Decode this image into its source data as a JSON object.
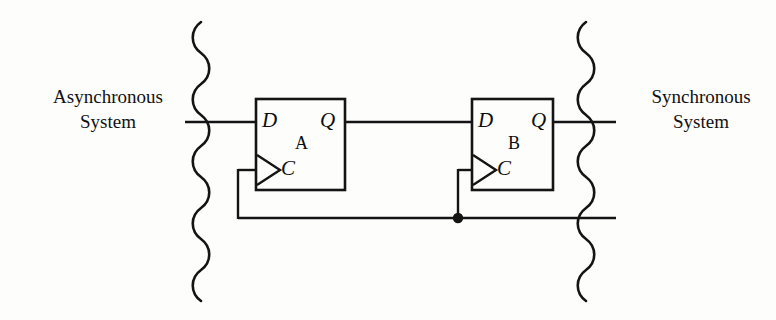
{
  "figure": {
    "background_color": "#fdfdfc",
    "line_color": "#111111"
  },
  "labels": {
    "async_system": {
      "line1": "Asynchronous",
      "line2": "System"
    },
    "sync_system": {
      "line1": "Synchronous",
      "line2": "System"
    }
  },
  "flipflops": [
    {
      "id": "ff-a",
      "name": "A",
      "d_label": "D",
      "q_label": "Q",
      "c_label": "C",
      "box": {
        "x": 256,
        "y": 99,
        "w": 89,
        "h": 91
      }
    },
    {
      "id": "ff-b",
      "name": "B",
      "d_label": "D",
      "q_label": "Q",
      "c_label": "C",
      "box": {
        "x": 472,
        "y": 99,
        "w": 81,
        "h": 91
      }
    }
  ],
  "wires": {
    "data_in_y": 122,
    "clock_bus_y": 218,
    "junction": {
      "x": 458,
      "y": 218
    }
  },
  "boundaries": {
    "left_x": 201,
    "right_x": 586,
    "top_y": 22,
    "bottom_y": 300
  }
}
